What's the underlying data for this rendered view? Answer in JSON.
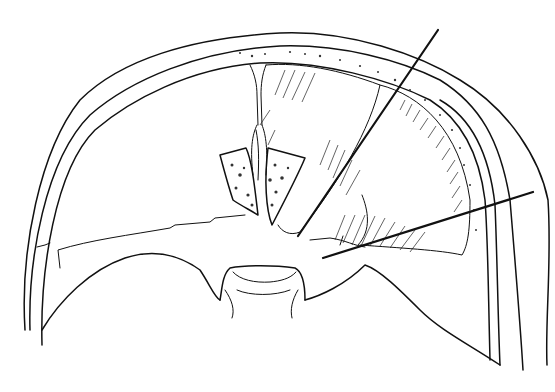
{
  "figure": {
    "type": "anatomical line illustration",
    "background": "#ffffff",
    "ink_color": "#111111",
    "labels": [],
    "leader_lines": [
      {
        "id": "leader-1",
        "x1": 438,
        "y1": 30,
        "x2": 298,
        "y2": 236
      },
      {
        "id": "leader-2",
        "x1": 533,
        "y1": 192,
        "x2": 323,
        "y2": 258
      }
    ]
  }
}
